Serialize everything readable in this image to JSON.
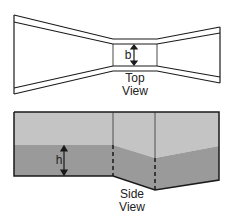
{
  "top_view": {
    "dimension_label": "b",
    "caption_line1": "Top",
    "caption_line2": "View"
  },
  "side_view": {
    "dimension_label": "h",
    "caption_line1": "Side",
    "caption_line2": "View"
  },
  "colors": {
    "stroke": "#1a1a1a",
    "air": "#c4c4c4",
    "water": "#9a9a9a"
  }
}
